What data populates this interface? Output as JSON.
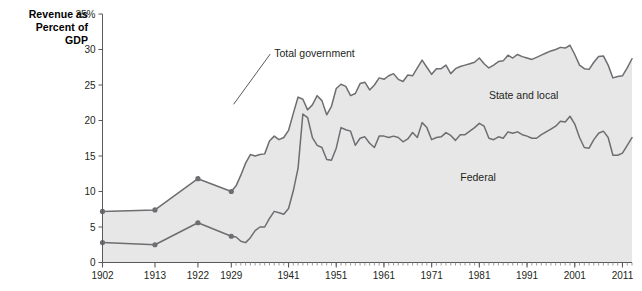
{
  "chart_data": {
    "type": "area",
    "title": "Revenue as\nPercent of\nGDP",
    "ylabel": "Revenue as Percent of GDP",
    "xlabel": "",
    "ylim": [
      0,
      35
    ],
    "xlim": [
      1902,
      2013
    ],
    "ytick_labels": [
      "0",
      "5",
      "10",
      "15",
      "20",
      "25",
      "30",
      "35%"
    ],
    "ytick_values": [
      0,
      5,
      10,
      15,
      20,
      25,
      30,
      35
    ],
    "xtick_labels": [
      "1902",
      "1913",
      "1922",
      "1929",
      "1941",
      "1951",
      "1961",
      "1971",
      "1981",
      "1991",
      "2001",
      "2011"
    ],
    "xtick_values": [
      1902,
      1913,
      1922,
      1929,
      1941,
      1951,
      1961,
      1971,
      1981,
      1991,
      2001,
      2011
    ],
    "grid": false,
    "legend_position": "inline-annotations",
    "annotations": [
      {
        "text": "Total government",
        "x": 1938,
        "y": 29.5,
        "leader_to_x": 1932,
        "leader_to_y": 22.0
      },
      {
        "text": "State and local",
        "x": 1983,
        "y": 23.5
      },
      {
        "text": "Federal",
        "x": 1977,
        "y": 12.0
      }
    ],
    "series": [
      {
        "name": "Total government",
        "color": "#6d6e71",
        "fill": "#e7e7e7",
        "markers_years": [
          1902,
          1913,
          1922,
          1929
        ],
        "x": [
          1902,
          1913,
          1922,
          1929,
          1930,
          1931,
          1932,
          1933,
          1934,
          1935,
          1936,
          1937,
          1938,
          1939,
          1940,
          1941,
          1942,
          1943,
          1944,
          1945,
          1946,
          1947,
          1948,
          1949,
          1950,
          1951,
          1952,
          1953,
          1954,
          1955,
          1956,
          1957,
          1958,
          1959,
          1960,
          1961,
          1962,
          1963,
          1964,
          1965,
          1966,
          1967,
          1968,
          1969,
          1970,
          1971,
          1972,
          1973,
          1974,
          1975,
          1976,
          1977,
          1978,
          1979,
          1980,
          1981,
          1982,
          1983,
          1984,
          1985,
          1986,
          1987,
          1988,
          1989,
          1990,
          1991,
          1992,
          1993,
          1994,
          1995,
          1996,
          1997,
          1998,
          1999,
          2000,
          2001,
          2002,
          2003,
          2004,
          2005,
          2006,
          2007,
          2008,
          2009,
          2010,
          2011,
          2012,
          2013
        ],
        "values": [
          7.2,
          7.4,
          11.8,
          10.0,
          10.8,
          12.3,
          14.0,
          15.2,
          15.0,
          15.2,
          15.3,
          17.1,
          17.8,
          17.3,
          17.6,
          18.6,
          21.0,
          23.3,
          23.0,
          21.5,
          22.2,
          23.5,
          22.8,
          20.8,
          22.0,
          24.5,
          25.1,
          24.8,
          23.5,
          23.8,
          25.2,
          25.4,
          24.3,
          25.0,
          26.0,
          25.8,
          26.3,
          26.6,
          25.8,
          25.5,
          26.4,
          26.3,
          27.4,
          28.5,
          27.5,
          26.5,
          27.3,
          27.3,
          27.8,
          26.6,
          27.3,
          27.6,
          27.8,
          28.0,
          28.2,
          28.8,
          28.0,
          27.4,
          27.8,
          28.3,
          28.4,
          29.2,
          28.8,
          29.3,
          29.0,
          28.8,
          28.6,
          28.9,
          29.2,
          29.5,
          29.8,
          30.0,
          30.3,
          30.2,
          30.6,
          29.3,
          27.8,
          27.3,
          27.2,
          28.2,
          29.0,
          29.1,
          27.8,
          26.0,
          26.2,
          26.3,
          27.4,
          28.7
        ]
      },
      {
        "name": "Federal",
        "color": "#6d6e71",
        "fill": "#e7e7e7",
        "markers_years": [
          1902,
          1913,
          1922,
          1929
        ],
        "x": [
          1902,
          1913,
          1922,
          1929,
          1930,
          1931,
          1932,
          1933,
          1934,
          1935,
          1936,
          1937,
          1938,
          1939,
          1940,
          1941,
          1942,
          1943,
          1944,
          1945,
          1946,
          1947,
          1948,
          1949,
          1950,
          1951,
          1952,
          1953,
          1954,
          1955,
          1956,
          1957,
          1958,
          1959,
          1960,
          1961,
          1962,
          1963,
          1964,
          1965,
          1966,
          1967,
          1968,
          1969,
          1970,
          1971,
          1972,
          1973,
          1974,
          1975,
          1976,
          1977,
          1978,
          1979,
          1980,
          1981,
          1982,
          1983,
          1984,
          1985,
          1986,
          1987,
          1988,
          1989,
          1990,
          1991,
          1992,
          1993,
          1994,
          1995,
          1996,
          1997,
          1998,
          1999,
          2000,
          2001,
          2002,
          2003,
          2004,
          2005,
          2006,
          2007,
          2008,
          2009,
          2010,
          2011,
          2012,
          2013
        ],
        "values": [
          2.8,
          2.5,
          5.6,
          3.7,
          3.6,
          3.0,
          2.8,
          3.5,
          4.5,
          5.0,
          5.0,
          6.2,
          7.2,
          7.0,
          6.8,
          7.6,
          10.1,
          13.3,
          20.9,
          20.4,
          17.6,
          16.5,
          16.2,
          14.5,
          14.4,
          16.1,
          19.0,
          18.7,
          18.5,
          16.5,
          17.5,
          17.7,
          16.8,
          16.2,
          17.8,
          17.8,
          17.6,
          17.8,
          17.6,
          17.0,
          17.4,
          18.3,
          17.6,
          19.7,
          19.0,
          17.3,
          17.6,
          17.7,
          18.3,
          17.9,
          17.2,
          18.0,
          18.0,
          18.5,
          19.0,
          19.6,
          19.2,
          17.5,
          17.3,
          17.7,
          17.5,
          18.4,
          18.2,
          18.4,
          18.0,
          17.8,
          17.5,
          17.5,
          18.0,
          18.4,
          18.8,
          19.2,
          19.9,
          19.8,
          20.6,
          19.5,
          17.6,
          16.2,
          16.1,
          17.3,
          18.2,
          18.5,
          17.6,
          15.1,
          15.1,
          15.4,
          16.5,
          17.6
        ]
      }
    ]
  },
  "axis": {
    "y_title": "Revenue as\nPercent of\nGDP"
  }
}
